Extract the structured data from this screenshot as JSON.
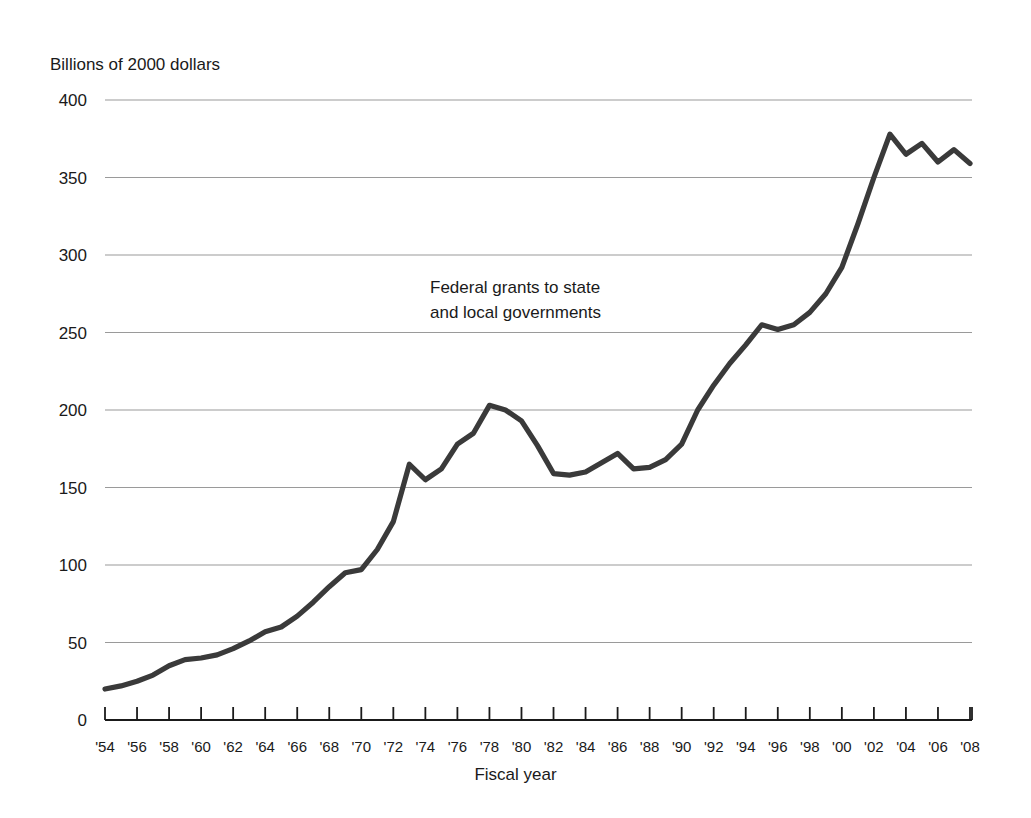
{
  "chart_data": {
    "type": "line",
    "title": "",
    "subtitle": "",
    "ylabel": "Billions of 2000 dollars",
    "xlabel": "Fiscal year",
    "annotation": "Federal grants to state\nand local governments",
    "grid": true,
    "legend_position": "none",
    "ylim": [
      0,
      400
    ],
    "yticks": [
      0,
      50,
      100,
      150,
      200,
      250,
      300,
      350,
      400
    ],
    "ytick_labels": [
      "0",
      "50",
      "100",
      "150",
      "200",
      "250",
      "300",
      "350",
      "400"
    ],
    "xlim": [
      1954,
      2008
    ],
    "xticks": [
      1954,
      1956,
      1958,
      1960,
      1962,
      1964,
      1966,
      1968,
      1970,
      1972,
      1974,
      1976,
      1978,
      1980,
      1982,
      1984,
      1986,
      1988,
      1990,
      1992,
      1994,
      1996,
      1998,
      2000,
      2002,
      2004,
      2006,
      2008
    ],
    "xtick_labels": [
      "'54",
      "'56",
      "'58",
      "'60",
      "'62",
      "'64",
      "'66",
      "'68",
      "'70",
      "'72",
      "'74",
      "'76",
      "'78",
      "'80",
      "'82",
      "'84",
      "'86",
      "'88",
      "'90",
      "'92",
      "'94",
      "'96",
      "'98",
      "'00",
      "'02",
      "'04",
      "'06",
      "'08"
    ],
    "line_color": "#3a3a3a",
    "grid_color": "#9a9a9a",
    "axis_color": "#1a1a1a",
    "series": [
      {
        "name": "Federal grants to state and local governments",
        "x": [
          1954,
          1955,
          1956,
          1957,
          1958,
          1959,
          1960,
          1961,
          1962,
          1963,
          1964,
          1965,
          1966,
          1967,
          1968,
          1969,
          1970,
          1971,
          1972,
          1973,
          1974,
          1975,
          1976,
          1977,
          1978,
          1979,
          1980,
          1981,
          1982,
          1983,
          1984,
          1985,
          1986,
          1987,
          1988,
          1989,
          1990,
          1991,
          1992,
          1993,
          1994,
          1995,
          1996,
          1997,
          1998,
          1999,
          2000,
          2001,
          2002,
          2003,
          2004,
          2005,
          2006,
          2007,
          2008
        ],
        "y": [
          20,
          22,
          25,
          29,
          35,
          39,
          40,
          42,
          46,
          51,
          57,
          60,
          67,
          76,
          86,
          95,
          97,
          110,
          128,
          165,
          155,
          162,
          178,
          185,
          203,
          200,
          193,
          177,
          159,
          158,
          160,
          166,
          172,
          162,
          163,
          168,
          178,
          200,
          216,
          230,
          242,
          255,
          252,
          255,
          263,
          275,
          292,
          320,
          350,
          378,
          365,
          372,
          360,
          368,
          359
        ]
      }
    ]
  }
}
